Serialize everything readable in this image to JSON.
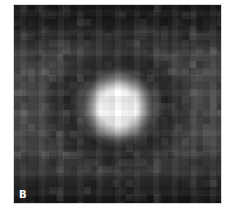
{
  "figure": {
    "panel_label": "B",
    "colors": {
      "core": "#ffffff",
      "halo": "#9a9a9a",
      "ring": "#2a2a2a",
      "background_mid": "#4a4a4a",
      "background_edge": "#171717",
      "label": "#ffffff"
    }
  }
}
